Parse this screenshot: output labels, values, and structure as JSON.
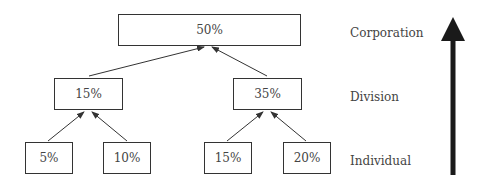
{
  "diagram": {
    "levels": [
      {
        "name": "Corporation"
      },
      {
        "name": "Division"
      },
      {
        "name": "Individual"
      }
    ],
    "nodes": {
      "corporation": {
        "value": "50%"
      },
      "division_left": {
        "value": "15%"
      },
      "division_right": {
        "value": "35%"
      },
      "individual_1": {
        "value": "5%"
      },
      "individual_2": {
        "value": "10%"
      },
      "individual_3": {
        "value": "15%"
      },
      "individual_4": {
        "value": "20%"
      }
    },
    "edges": [
      {
        "from": "individual_1",
        "to": "division_left"
      },
      {
        "from": "individual_2",
        "to": "division_left"
      },
      {
        "from": "individual_3",
        "to": "division_right"
      },
      {
        "from": "individual_4",
        "to": "division_right"
      },
      {
        "from": "division_left",
        "to": "corporation"
      },
      {
        "from": "division_right",
        "to": "corporation"
      }
    ],
    "aggregation_arrow": {
      "direction": "up"
    }
  }
}
